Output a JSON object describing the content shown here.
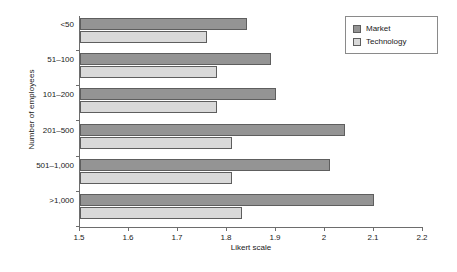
{
  "chart_data": {
    "type": "bar",
    "orientation": "horizontal",
    "title": "",
    "xlabel": "Likert scale",
    "ylabel": "Number of employees",
    "categories": [
      "<50",
      "51–100",
      "101–200",
      "201–500",
      "501–1,000",
      ">1,000"
    ],
    "series": [
      {
        "name": "Market",
        "color": "#949494",
        "values": [
          1.84,
          1.89,
          1.9,
          2.04,
          2.01,
          2.1
        ]
      },
      {
        "name": "Technology",
        "color": "#d9d9d9",
        "values": [
          1.76,
          1.78,
          1.78,
          1.81,
          1.81,
          1.83
        ]
      }
    ],
    "xlim": [
      1.5,
      2.2
    ],
    "xticks": [
      1.5,
      1.6,
      1.7,
      1.8,
      1.9,
      2.0,
      2.1,
      2.2
    ],
    "xtick_labels": [
      "1.5",
      "1.6",
      "1.7",
      "1.8",
      "1.9",
      "2",
      "2.1",
      "2.2"
    ],
    "grid": false,
    "legend_position": "top-right"
  },
  "legend": {
    "items": [
      {
        "label": "Market",
        "swatch": "market"
      },
      {
        "label": "Technology",
        "swatch": "technology"
      }
    ]
  }
}
